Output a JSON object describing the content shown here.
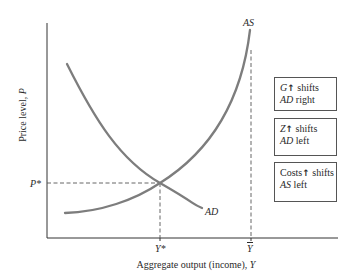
{
  "diagram": {
    "axes": {
      "x_label_prefix": "Aggregate output (income), ",
      "x_label_var": "Y",
      "y_label_prefix": "Price level, ",
      "y_label_var": "P"
    },
    "curves": {
      "ad": {
        "label": "AD",
        "color": "#7d7d7d"
      },
      "as": {
        "label": "AS",
        "color": "#7d7d7d"
      }
    },
    "markers": {
      "p_star": "P*",
      "y_star": "Y*",
      "y_bar": "Y"
    },
    "boxes": [
      {
        "var": "G",
        "arrow": "↑",
        "rest": " shifts",
        "line2_var": "AD",
        "line2_rest": " right"
      },
      {
        "var": "Z",
        "arrow": "↑",
        "rest": " shifts",
        "line2_var": "AD",
        "line2_rest": " left"
      },
      {
        "var": "Costs",
        "arrow": "↑",
        "rest": " shifts",
        "line2_var": "AS",
        "line2_rest": " left"
      }
    ],
    "colors": {
      "axis": "#333333",
      "curve": "#7d7d7d",
      "dashed": "#555555",
      "box_border": "#555555",
      "text": "#2a2a2a"
    }
  }
}
